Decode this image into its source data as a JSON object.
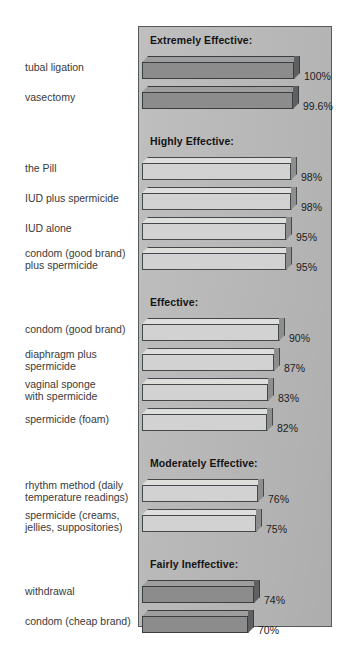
{
  "chart_data": {
    "type": "bar",
    "title": "",
    "xlabel": "",
    "ylabel": "",
    "orientation": "horizontal",
    "grid": false,
    "legend": "none",
    "xlim": [
      0,
      100
    ],
    "value_unit": "%",
    "groups": [
      {
        "header": "Extremely Effective:",
        "shade": "dark",
        "items": [
          {
            "label": "tubal ligation",
            "value": 100,
            "value_text": "100%"
          },
          {
            "label": "vasectomy",
            "value": 99.6,
            "value_text": "99.6%"
          }
        ]
      },
      {
        "header": "Highly Effective:",
        "shade": "light",
        "items": [
          {
            "label": "the Pill",
            "value": 98,
            "value_text": "98%"
          },
          {
            "label": "IUD plus spermicide",
            "value": 98,
            "value_text": "98%"
          },
          {
            "label": "IUD alone",
            "value": 95,
            "value_text": "95%"
          },
          {
            "label": "condom (good brand)\nplus spermicide",
            "value": 95,
            "value_text": "95%"
          }
        ]
      },
      {
        "header": "Effective:",
        "shade": "light",
        "items": [
          {
            "label": "condom (good brand)",
            "value": 90,
            "value_text": "90%"
          },
          {
            "label": "diaphragm plus\nspermicide",
            "value": 87,
            "value_text": "87%"
          },
          {
            "label": "vaginal sponge\nwith spermicide",
            "value": 83,
            "value_text": "83%"
          },
          {
            "label": "spermicide (foam)",
            "value": 82,
            "value_text": "82%"
          }
        ]
      },
      {
        "header": "Moderately Effective:",
        "shade": "light",
        "items": [
          {
            "label": "rhythm method (daily\ntemperature readings)",
            "value": 76,
            "value_text": "76%"
          },
          {
            "label": "spermicide (creams,\njellies, suppositories)",
            "value": 75,
            "value_text": "75%"
          }
        ]
      },
      {
        "header": "Fairly Ineffective:",
        "shade": "dark",
        "items": [
          {
            "label": "withdrawal",
            "value": 74,
            "value_text": "74%"
          },
          {
            "label": "condom (cheap brand)",
            "value": 70,
            "value_text": "70%"
          }
        ]
      },
      {
        "header": "Unreliable:",
        "shade": "dark",
        "items": [
          {
            "label": "douche",
            "value": 40,
            "value_text": "40%"
          },
          {
            "label": "chance (no method)",
            "value": 10,
            "value_text": "10%"
          }
        ]
      }
    ]
  },
  "colors": {
    "panel_background": "#b8b8b8",
    "panel_border": "#555a5c",
    "bar_light_front": "#d2d2d2",
    "bar_light_top": "#dededc",
    "bar_light_side": "#8e8e8e",
    "bar_dark_front": "#8c8c8c",
    "bar_dark_top": "#9d9d9d",
    "bar_dark_side": "#5f6062",
    "bar_outline": "#43484a",
    "label_text": "#3a3a3a",
    "header_text": "#141414",
    "page_background": "#ffffff"
  }
}
